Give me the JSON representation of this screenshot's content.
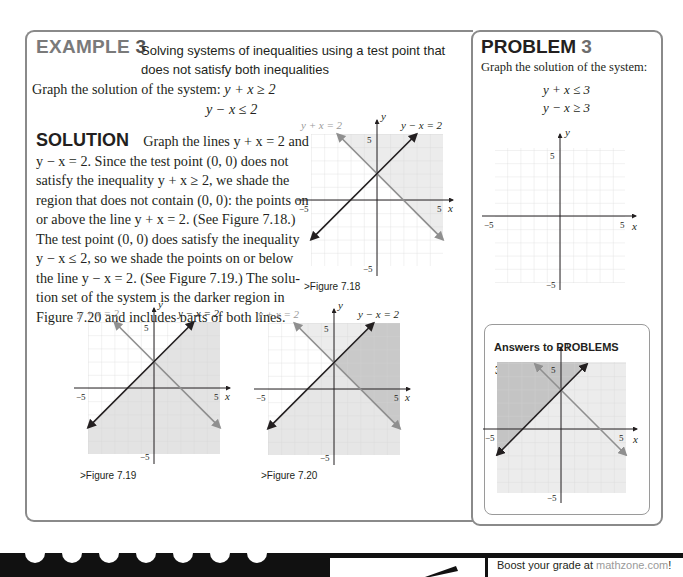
{
  "example": {
    "label": "EXAMPLE",
    "number": "3",
    "subtitle_line1": "Solving systems of inequalities using a test point that",
    "subtitle_line2": "does not satisfy both inequalities",
    "prompt": "Graph the solution of the system:",
    "inequality_1": "y + x ≥ 2",
    "inequality_2": "y − x ≤ 2",
    "solution_label": "SOLUTION",
    "solution_lines": [
      "Graph the lines y + x = 2 and",
      "y − x = 2. Since the test point (0, 0) does not",
      "satisfy the inequality y + x ≥ 2, we shade the",
      "region that does not contain (0, 0): the points on",
      "or above the line y + x = 2. (See Figure 7.18.)",
      "The test point (0, 0) does satisfy the inequality",
      "y − x ≤ 2, so we shade the points on or below",
      "the line y − x = 2. (See Figure 7.19.) The solu-",
      "tion set of the system is the darker region in",
      "Figure 7.20 and includes parts of both lines."
    ]
  },
  "figures": [
    {
      "caption": ">Figure 7.18",
      "line1_label": "y + x = 2",
      "line2_label": "y − x = 2",
      "shading": "above y+x=2"
    },
    {
      "caption": ">Figure 7.19",
      "line1_label": "y + x = 2",
      "line2_label": "y − x = 2",
      "shading": "below y−x=2"
    },
    {
      "caption": ">Figure 7.20",
      "line1_label": "y + x = 2",
      "line2_label": "y − x = 2",
      "shading": "both, overlap darker"
    }
  ],
  "axis": {
    "x_label": "x",
    "y_label": "y",
    "pos_tick": "5",
    "neg_tick": "−5"
  },
  "problem": {
    "label": "PROBLEM",
    "number": "3",
    "prompt": "Graph the solution of the system:",
    "inequality_1": "y + x ≤ 3",
    "inequality_2": "y − x ≥ 3"
  },
  "answers": {
    "heading": "Answers to PROBLEMS",
    "item_number": "3."
  },
  "footer": {
    "promo_prefix": "Boost your grade at ",
    "promo_link": "mathzone.com",
    "promo_suffix": "!"
  },
  "colors": {
    "border": "#8a8a8a",
    "light_shade": "#ececec",
    "dark_shade": "#c9c9c9",
    "gray_line": "#8f8f8f",
    "dark_line": "#231f20"
  }
}
